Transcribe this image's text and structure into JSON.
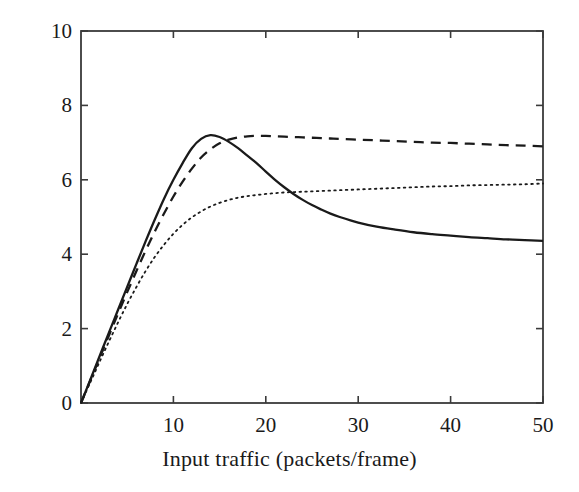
{
  "chart_data": {
    "type": "line",
    "title": "",
    "subtitle": "",
    "xlabel": "Input traffic (packets/frame)",
    "ylabel": "Throughput (packets/frame)",
    "xlim": [
      0,
      50
    ],
    "ylim": [
      0,
      10
    ],
    "xticks": [
      10,
      20,
      30,
      40,
      50
    ],
    "xtick_labels": [
      "10",
      "20",
      "30",
      "40",
      "50"
    ],
    "yticks": [
      0,
      2,
      4,
      6,
      8,
      10
    ],
    "ytick_labels": [
      "0",
      "2",
      "4",
      "6",
      "8",
      "10"
    ],
    "grid": false,
    "legend": "none",
    "line_color": "#1a1a1a",
    "axis_color": "#3a3a3a",
    "background": "#ffffff",
    "x": [
      0,
      1,
      2,
      3,
      4,
      5,
      6,
      7,
      8,
      9,
      10,
      11,
      12,
      13,
      14,
      15,
      16,
      17,
      18,
      19,
      20,
      21,
      22,
      23,
      24,
      25,
      26,
      27,
      28,
      30,
      32,
      34,
      36,
      38,
      40,
      42,
      44,
      46,
      48,
      50
    ],
    "series": [
      {
        "name": "solid-curve",
        "style": "solid",
        "values": [
          0.0,
          0.62,
          1.25,
          1.88,
          2.5,
          3.12,
          3.74,
          4.35,
          4.94,
          5.5,
          6.0,
          6.45,
          6.85,
          7.1,
          7.2,
          7.15,
          7.02,
          6.85,
          6.65,
          6.45,
          6.22,
          6.0,
          5.8,
          5.62,
          5.46,
          5.32,
          5.2,
          5.09,
          5.0,
          4.85,
          4.74,
          4.66,
          4.59,
          4.54,
          4.5,
          4.46,
          4.43,
          4.4,
          4.38,
          4.36
        ]
      },
      {
        "name": "dashed-curve",
        "style": "dashed",
        "values": [
          0.0,
          0.6,
          1.2,
          1.8,
          2.4,
          2.98,
          3.55,
          4.1,
          4.62,
          5.1,
          5.55,
          5.95,
          6.3,
          6.6,
          6.82,
          6.98,
          7.08,
          7.14,
          7.17,
          7.18,
          7.18,
          7.17,
          7.16,
          7.15,
          7.14,
          7.13,
          7.12,
          7.11,
          7.1,
          7.08,
          7.06,
          7.04,
          7.02,
          7.0,
          6.99,
          6.97,
          6.95,
          6.93,
          6.92,
          6.9
        ]
      },
      {
        "name": "dotted-curve",
        "style": "dotted",
        "values": [
          0.0,
          0.55,
          1.1,
          1.64,
          2.16,
          2.66,
          3.12,
          3.55,
          3.93,
          4.26,
          4.55,
          4.79,
          4.99,
          5.15,
          5.28,
          5.38,
          5.46,
          5.52,
          5.56,
          5.59,
          5.62,
          5.64,
          5.66,
          5.67,
          5.68,
          5.69,
          5.7,
          5.71,
          5.72,
          5.74,
          5.76,
          5.78,
          5.8,
          5.82,
          5.83,
          5.85,
          5.86,
          5.87,
          5.88,
          5.9
        ]
      }
    ]
  }
}
